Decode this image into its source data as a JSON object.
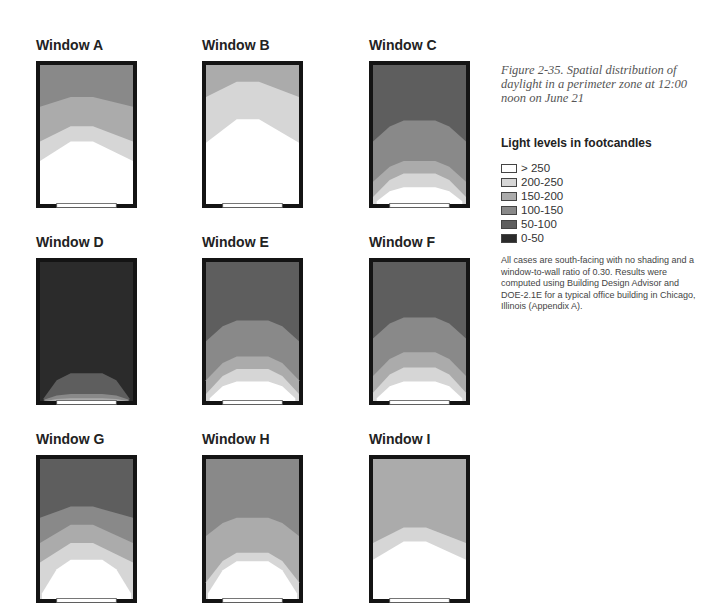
{
  "figure": {
    "caption": "Figure 2-35. Spatial distribution of daylight in a perimeter zone at 12:00 noon on June 21",
    "note": "All cases are south-facing with no shading and a window-to-wall ratio of 0.30. Results were computed using Building Design Advisor and DOE-2.1E for a typical office building in Chicago, Illinois (Appendix A)."
  },
  "legend": {
    "title": "Light levels in footcandles",
    "items": [
      {
        "label": "> 250",
        "key": "gt250",
        "color": "#ffffff"
      },
      {
        "label": "200-250",
        "key": "b200",
        "color": "#d6d6d6"
      },
      {
        "label": "150-200",
        "key": "b150",
        "color": "#ababab"
      },
      {
        "label": "100-150",
        "key": "b100",
        "color": "#898989"
      },
      {
        "label": "50-100",
        "key": "b50",
        "color": "#5e5e5e"
      },
      {
        "label": "0-50",
        "key": "b0",
        "color": "#2b2b2b"
      }
    ]
  },
  "colors": {
    "wall": "#141414",
    "window_glass": "#ffffff",
    "window_outline": "#555555"
  },
  "windows": [
    {
      "title": "Window A",
      "far_band": "b100",
      "contours": [
        {
          "band": "b150",
          "type": "peak",
          "edge": 0.7,
          "center": 0.77
        },
        {
          "band": "b200",
          "type": "peak",
          "edge": 0.45,
          "center": 0.56
        },
        {
          "band": "gt250",
          "type": "peak",
          "edge": 0.31,
          "center": 0.45
        }
      ]
    },
    {
      "title": "Window B",
      "far_band": "b150",
      "contours": [
        {
          "band": "b200",
          "type": "peak",
          "edge": 0.77,
          "center": 0.88
        },
        {
          "band": "gt250",
          "type": "peak",
          "edge": 0.44,
          "center": 0.61
        }
      ]
    },
    {
      "title": "Window C",
      "far_band": "b50",
      "contours": [
        {
          "band": "b100",
          "type": "dome",
          "edge": 0.45,
          "center": 0.6
        },
        {
          "band": "b150",
          "type": "dome",
          "edge": 0.16,
          "center": 0.31
        },
        {
          "band": "b200",
          "type": "dome",
          "edge": 0.05,
          "center": 0.22
        },
        {
          "band": "gt250",
          "type": "dome",
          "edge": 0.02,
          "center": 0.12
        }
      ]
    },
    {
      "title": "Window D",
      "far_band": "b0",
      "contours": [
        {
          "band": "b50",
          "type": "dome",
          "edge": 0.02,
          "center": 0.2
        },
        {
          "band": "b100",
          "type": "dome",
          "edge": 0.01,
          "center": 0.05
        },
        {
          "band": "b150",
          "type": "dome",
          "edge": 0.0,
          "center": 0.02
        }
      ]
    },
    {
      "title": "Window E",
      "far_band": "b50",
      "contours": [
        {
          "band": "b100",
          "type": "dome",
          "edge": 0.43,
          "center": 0.58
        },
        {
          "band": "b150",
          "type": "dome",
          "edge": 0.15,
          "center": 0.32
        },
        {
          "band": "b200",
          "type": "dome",
          "edge": 0.05,
          "center": 0.23
        },
        {
          "band": "gt250",
          "type": "dome",
          "edge": 0.02,
          "center": 0.14
        }
      ]
    },
    {
      "title": "Window F",
      "far_band": "b50",
      "contours": [
        {
          "band": "b100",
          "type": "dome",
          "edge": 0.45,
          "center": 0.6
        },
        {
          "band": "b150",
          "type": "dome",
          "edge": 0.18,
          "center": 0.35
        },
        {
          "band": "b200",
          "type": "dome",
          "edge": 0.06,
          "center": 0.24
        },
        {
          "band": "gt250",
          "type": "dome",
          "edge": 0.02,
          "center": 0.14
        }
      ]
    },
    {
      "title": "Window G",
      "far_band": "b50",
      "contours": [
        {
          "band": "b100",
          "type": "peak",
          "edge": 0.58,
          "center": 0.66
        },
        {
          "band": "b150",
          "type": "peak",
          "edge": 0.4,
          "center": 0.53
        },
        {
          "band": "b200",
          "type": "peak",
          "edge": 0.26,
          "center": 0.4
        },
        {
          "band": "gt250",
          "type": "dome",
          "edge": 0.04,
          "center": 0.28
        }
      ]
    },
    {
      "title": "Window H",
      "far_band": "b100",
      "contours": [
        {
          "band": "b150",
          "type": "dome",
          "edge": 0.45,
          "center": 0.58
        },
        {
          "band": "b200",
          "type": "dome",
          "edge": 0.12,
          "center": 0.33
        },
        {
          "band": "gt250",
          "type": "dome",
          "edge": 0.04,
          "center": 0.27
        }
      ]
    },
    {
      "title": "Window I",
      "far_band": "b150",
      "contours": [
        {
          "band": "b200",
          "type": "peak",
          "edge": 0.4,
          "center": 0.51
        },
        {
          "band": "gt250",
          "type": "peak",
          "edge": 0.28,
          "center": 0.41
        }
      ]
    }
  ]
}
